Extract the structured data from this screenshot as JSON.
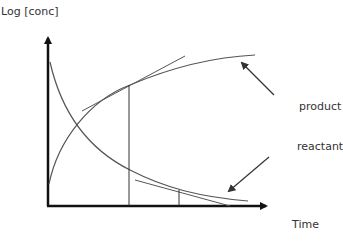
{
  "diagram": {
    "y_axis_label": "Log [conc]",
    "x_axis_label": "Time",
    "annotations": {
      "product": "product",
      "reactant": "reactant"
    },
    "elements": [
      {
        "name": "product-curve",
        "description": "rising curve that levels off"
      },
      {
        "name": "reactant-curve",
        "description": "decaying curve"
      },
      {
        "name": "product-tangent",
        "description": "tangent line on product curve at first time mark"
      },
      {
        "name": "reactant-tangent",
        "description": "tangent line on reactant curve at second time mark"
      },
      {
        "name": "time-marker-1",
        "description": "vertical line at first time point"
      },
      {
        "name": "time-marker-2",
        "description": "vertical line at second time point"
      }
    ],
    "colors": {
      "axis": "#111111",
      "curve": "#555555",
      "text": "#333333"
    }
  }
}
